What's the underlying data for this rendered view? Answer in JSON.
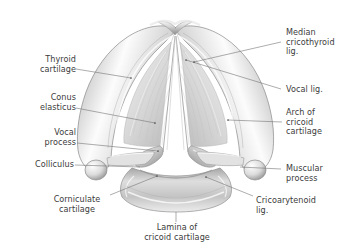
{
  "figure": {
    "background_color": "#ffffff",
    "label_color": "#3b3b3b",
    "leader_color": "#6e6e6e",
    "cartilage_fill": "#e9e9e9",
    "cartilage_shade": "#9a9a9a",
    "cartilage_highlight": "#fbfbfb",
    "membrane_fill": "#dcdcdc"
  },
  "labels": [
    {
      "id": "thyroid-cartilage",
      "text": "Thyroid\ncartilage",
      "align": "right"
    },
    {
      "id": "conus-elasticus",
      "text": "Conus\nelasticus",
      "align": "right"
    },
    {
      "id": "vocal-process",
      "text": "Vocal\nprocess",
      "align": "right"
    },
    {
      "id": "colliculus",
      "text": "Colliculus",
      "align": "right"
    },
    {
      "id": "corniculate-cartilage",
      "text": "Corniculate\ncartilage",
      "align": "center"
    },
    {
      "id": "lamina-of-cricoid",
      "text": "Lamina of\ncricoid cartilage",
      "align": "center"
    },
    {
      "id": "cricoarytenoid-lig",
      "text": "Cricoarytenoid\nlig.",
      "align": "left"
    },
    {
      "id": "muscular-process",
      "text": "Muscular\nprocess",
      "align": "left"
    },
    {
      "id": "arch-of-cricoid",
      "text": "Arch of\ncricoid\ncartilage",
      "align": "left"
    },
    {
      "id": "vocal-lig",
      "text": "Vocal lig.",
      "align": "left"
    },
    {
      "id": "median-cricothyroid-lig",
      "text": "Median\ncricothyroid\nlig.",
      "align": "left"
    }
  ]
}
